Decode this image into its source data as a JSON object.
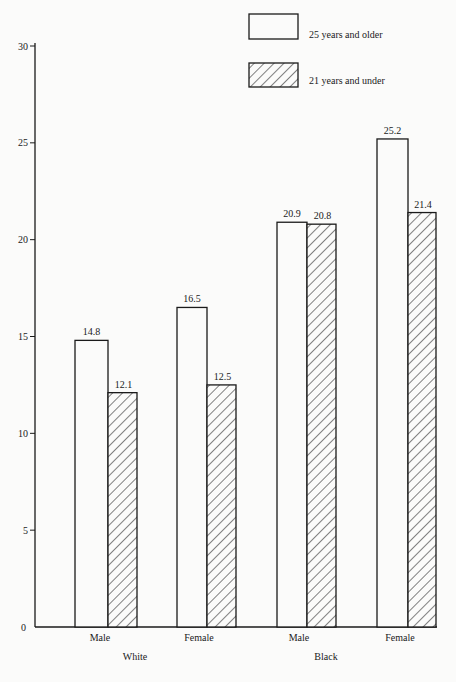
{
  "chart_data": {
    "type": "bar",
    "title": "",
    "xlabel": "",
    "ylabel": "",
    "ylim": [
      0,
      30
    ],
    "yticks": [
      0,
      5,
      10,
      15,
      20,
      25,
      30
    ],
    "grid": false,
    "legend_position": "top-right",
    "groups": [
      {
        "label": "White",
        "categories": [
          "Male",
          "Female"
        ]
      },
      {
        "label": "Black",
        "categories": [
          "Male",
          "Female"
        ]
      }
    ],
    "categories": [
      "White Male",
      "White Female",
      "Black Male",
      "Black Female"
    ],
    "category_labels": [
      "Male",
      "Female",
      "Male",
      "Female"
    ],
    "series": [
      {
        "name": "25 years and older",
        "fill": "plain",
        "values": [
          14.8,
          16.5,
          20.9,
          25.2
        ]
      },
      {
        "name": "21 years and under",
        "fill": "hatched",
        "values": [
          12.1,
          12.5,
          20.8,
          21.4
        ]
      }
    ]
  },
  "colors": {
    "background": "#fbfbfa",
    "ink": "#1a1a1a"
  }
}
